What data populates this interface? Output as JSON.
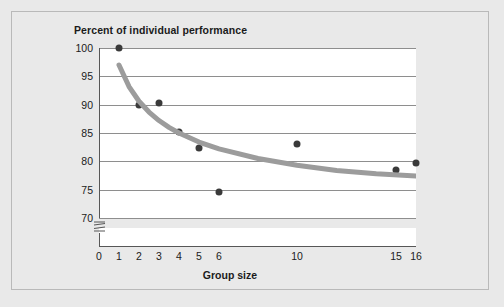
{
  "figure": {
    "background_color": "#e9e9e9",
    "panel_border_color": "#b9b9b9",
    "plot_background": "#ffffff"
  },
  "chart_data": {
    "type": "scatter",
    "title": "Percent of individual performance",
    "xlabel": "Group size",
    "ylabel": "Percent of individual performance",
    "grid": "horizontal",
    "legend": "none",
    "axis_break": true,
    "axis_break_axis": "y",
    "xlim": [
      0,
      16
    ],
    "ylim": [
      70,
      100
    ],
    "xticks": [
      0,
      1,
      2,
      3,
      4,
      5,
      6,
      10,
      15,
      16
    ],
    "xticklabels": [
      "0",
      "1",
      "2",
      "3",
      "4",
      "5",
      "6",
      "10",
      "15",
      "16"
    ],
    "yticks": [
      70,
      75,
      80,
      85,
      90,
      95,
      100
    ],
    "yticklabels": [
      "70",
      "75",
      "80",
      "85",
      "90",
      "95",
      "100"
    ],
    "x": [
      1,
      2,
      3,
      4,
      5,
      6,
      10,
      15,
      16
    ],
    "y": [
      100,
      90,
      90.3,
      85.2,
      82.4,
      74.6,
      83,
      78.5,
      79.7
    ],
    "point_color": "#3a3a3a",
    "series": [
      {
        "name": "Observed group performance",
        "type": "scatter",
        "points": [
          {
            "x": 1,
            "y": 100
          },
          {
            "x": 2,
            "y": 90
          },
          {
            "x": 3,
            "y": 90.3
          },
          {
            "x": 4,
            "y": 85.2
          },
          {
            "x": 5,
            "y": 82.4
          },
          {
            "x": 6,
            "y": 74.6
          },
          {
            "x": 10,
            "y": 83
          },
          {
            "x": 15,
            "y": 78.5
          },
          {
            "x": 16,
            "y": 79.7
          }
        ]
      },
      {
        "name": "Fitted trend curve",
        "type": "line",
        "color": "#9c9c9c",
        "linewidth": 5,
        "points": [
          {
            "x": 1,
            "y": 97.0
          },
          {
            "x": 1.5,
            "y": 93.2
          },
          {
            "x": 2,
            "y": 90.6
          },
          {
            "x": 2.5,
            "y": 88.7
          },
          {
            "x": 3,
            "y": 87.2
          },
          {
            "x": 3.5,
            "y": 86.0
          },
          {
            "x": 4,
            "y": 85.0
          },
          {
            "x": 5,
            "y": 83.4
          },
          {
            "x": 6,
            "y": 82.2
          },
          {
            "x": 8,
            "y": 80.5
          },
          {
            "x": 10,
            "y": 79.3
          },
          {
            "x": 12,
            "y": 78.4
          },
          {
            "x": 14,
            "y": 77.8
          },
          {
            "x": 16,
            "y": 77.4
          }
        ]
      }
    ]
  }
}
